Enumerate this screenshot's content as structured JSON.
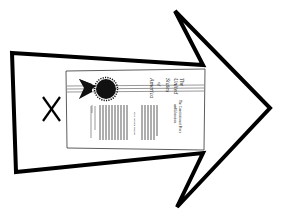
{
  "illustration": {
    "description": "Arrow pointing right containing a sealed document, with an X mark",
    "arrow": {
      "stroke_color": "#000000",
      "fill_color": "#ffffff",
      "points": [
        [
          12,
          53
        ],
        [
          203,
          65
        ],
        [
          175,
          11
        ],
        [
          270,
          108
        ],
        [
          177,
          207
        ],
        [
          203,
          153
        ],
        [
          16,
          172
        ]
      ]
    },
    "x_mark": {
      "label": "X"
    },
    "document": {
      "title_lines": [
        "The",
        "United",
        "States",
        "of",
        "America"
      ],
      "subtitle_lines": [
        "The Constitution of Peace",
        "and Liberation"
      ],
      "small_label": "First Written Record",
      "seal_color": "#000000",
      "ribbon_color": "#999999"
    }
  }
}
